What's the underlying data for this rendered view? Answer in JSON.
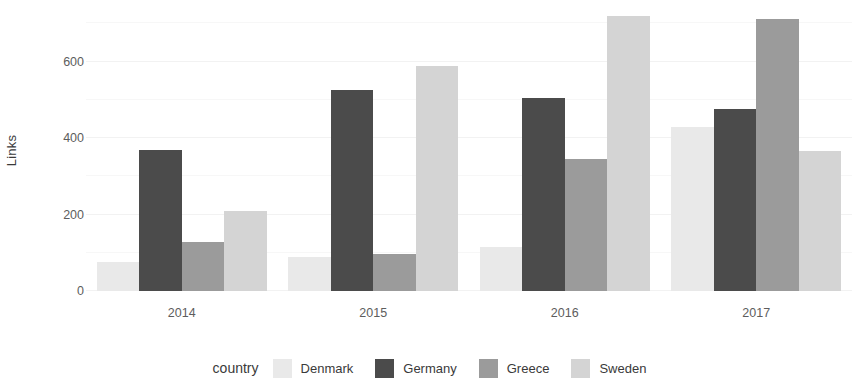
{
  "chart_data": {
    "type": "bar",
    "title": "",
    "subtitle": "",
    "xlabel": "",
    "ylabel": "Links",
    "categories": [
      "2014",
      "2015",
      "2016",
      "2017"
    ],
    "series": [
      {
        "name": "Denmark",
        "color": "#e9e9e9",
        "values": [
          75,
          88,
          115,
          430
        ]
      },
      {
        "name": "Germany",
        "color": "#4b4b4b",
        "values": [
          370,
          525,
          505,
          475
        ]
      },
      {
        "name": "Greece",
        "color": "#9b9b9b",
        "values": [
          128,
          98,
          345,
          710
        ]
      },
      {
        "name": "Sweden",
        "color": "#d4d4d4",
        "values": [
          208,
          588,
          720,
          365
        ]
      }
    ],
    "legend_title": "country",
    "legend_position": "bottom",
    "ylim": [
      0,
      740
    ],
    "yticks": [
      0,
      200,
      400,
      600
    ],
    "ytick_labels": [
      "0",
      "200",
      "400",
      "600"
    ],
    "grid": true,
    "grid_minor_ticks": [
      100,
      300,
      500,
      700
    ],
    "bar_style": "grouped"
  }
}
